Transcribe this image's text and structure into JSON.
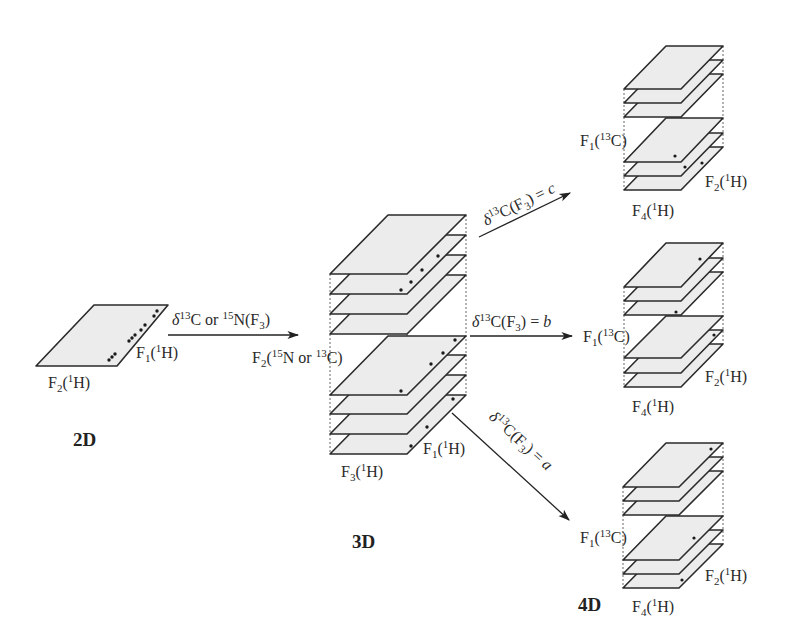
{
  "colors": {
    "plane_fill": "#ececec",
    "stroke": "#2a2a2a",
    "background": "#ffffff"
  },
  "panels": {
    "2d": {
      "label": "2D",
      "axis_x": {
        "base": "F",
        "sub": "2",
        "nucleus_sup": "1",
        "nucleus": "H"
      },
      "axis_y": {
        "base": "F",
        "sub": "1",
        "nucleus_sup": "1",
        "nucleus": "H"
      }
    },
    "3d": {
      "label": "3D",
      "axis_x": {
        "base": "F",
        "sub": "3",
        "nucleus_sup": "1",
        "nucleus": "H"
      },
      "axis_y": {
        "base": "F",
        "sub": "1",
        "nucleus_sup": "1",
        "nucleus": "H"
      },
      "axis_z": {
        "text_a": "F",
        "sub": "2",
        "text_b": "(",
        "sup1": "15",
        "text_c": "N or ",
        "sup2": "13",
        "text_d": "C)"
      }
    },
    "4d": {
      "label": "4D",
      "stacks": [
        {
          "id": "c",
          "axis_z": {
            "base": "F",
            "sub": "1",
            "sup": "13",
            "nucleus": "C"
          },
          "axis_y": {
            "base": "F",
            "sub": "2",
            "sup": "1",
            "nucleus": "H"
          },
          "axis_x": {
            "base": "F",
            "sub": "4",
            "sup": "1",
            "nucleus": "H"
          }
        },
        {
          "id": "b",
          "axis_z": {
            "base": "F",
            "sub": "1",
            "sup": "13",
            "nucleus": "C"
          },
          "axis_y": {
            "base": "F",
            "sub": "2",
            "sup": "1",
            "nucleus": "H"
          },
          "axis_x": {
            "base": "F",
            "sub": "4",
            "sup": "1",
            "nucleus": "H"
          }
        },
        {
          "id": "a",
          "axis_z": {
            "base": "F",
            "sub": "1",
            "sup": "13",
            "nucleus": "C"
          },
          "axis_y": {
            "base": "F",
            "sub": "2",
            "sup": "1",
            "nucleus": "H"
          },
          "axis_x": {
            "base": "F",
            "sub": "4",
            "sup": "1",
            "nucleus": "H"
          }
        }
      ]
    }
  },
  "arrows": {
    "2d_to_3d": {
      "delta": "δ",
      "sup1": "13",
      "text1": "C or ",
      "sup2": "15",
      "text2": "N(F",
      "sub": "3",
      "text3": ")"
    },
    "to_c": {
      "delta": "δ",
      "sup": "13",
      "text": "C(F",
      "sub": "3",
      "eq": ") = ",
      "val": "c"
    },
    "to_b": {
      "delta": "δ",
      "sup": "13",
      "text": "C(F",
      "sub": "3",
      "eq": ") = ",
      "val": "b"
    },
    "to_a": {
      "delta": "δ",
      "sup": "13",
      "text": "C(F",
      "sub": "3",
      "eq": ") = ",
      "val": "a"
    }
  }
}
